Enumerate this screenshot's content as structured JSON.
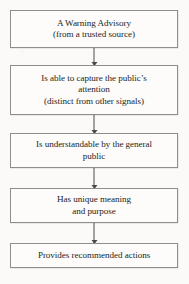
{
  "diagram": {
    "type": "flowchart",
    "orientation": "vertical",
    "colors": {
      "page_background": "#fbfaf8",
      "node_background": "#fdfcfa",
      "node_border": "#8e8e8e",
      "connector": "#4a4a4a",
      "text": "#1c1c1c"
    },
    "nodes": [
      {
        "id": "node-1",
        "lines": [
          "A Warning Advisory",
          "(from a trusted source)"
        ]
      },
      {
        "id": "node-2",
        "lines": [
          "Is able to capture the public’s",
          "attention",
          "(distinct from other signals)"
        ]
      },
      {
        "id": "node-3",
        "lines": [
          "Is understandable by the general",
          "public"
        ]
      },
      {
        "id": "node-4",
        "lines": [
          "Has unique meaning",
          "and purpose"
        ]
      },
      {
        "id": "node-5",
        "lines": [
          "Provides recommended actions"
        ]
      }
    ],
    "connectors": [
      {
        "id": "conn-1",
        "from": "node-1",
        "to": "node-2",
        "arrow": "down"
      },
      {
        "id": "conn-2",
        "from": "node-2",
        "to": "node-3",
        "arrow": "down"
      },
      {
        "id": "conn-3",
        "from": "node-3",
        "to": "node-4",
        "arrow": "down"
      },
      {
        "id": "conn-4",
        "from": "node-4",
        "to": "node-5",
        "arrow": "down"
      }
    ]
  }
}
